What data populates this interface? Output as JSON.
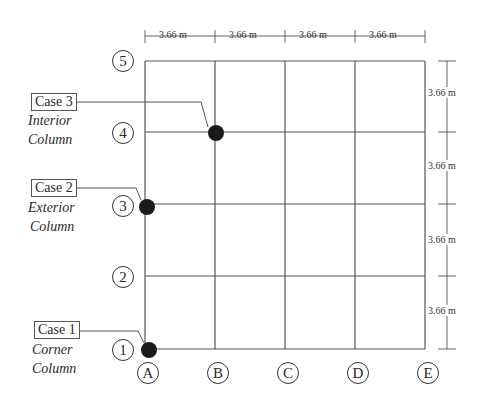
{
  "diagram": {
    "type": "structural-grid-plan",
    "grid_lines_x": [
      "A",
      "B",
      "C",
      "D",
      "E"
    ],
    "grid_lines_y": [
      "1",
      "2",
      "3",
      "4",
      "5"
    ],
    "spacing_x_labels": [
      "3.66 m",
      "3.66 m",
      "3.66 m",
      "3.66 m"
    ],
    "spacing_y_labels": [
      "3.66 m",
      "3.66 m",
      "3.66 m",
      "3.66 m"
    ],
    "cases": [
      {
        "label": "Case 3",
        "line1": "Interior",
        "line2": "Column",
        "location": "B4"
      },
      {
        "label": "Case 2",
        "line1": "Exterior",
        "line2": "Column",
        "location": "A3"
      },
      {
        "label": "Case 1",
        "line1": "Corner",
        "line2": "Column",
        "location": "A1"
      }
    ],
    "colors": {
      "line": "#555555",
      "column": "#1a1a1a"
    }
  }
}
